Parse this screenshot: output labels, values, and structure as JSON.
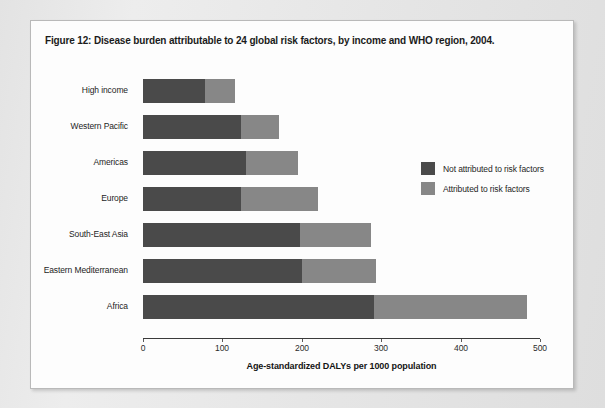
{
  "figure": {
    "title": "Figure 12: Disease burden attributable to 24 global risk factors, by income and WHO region, 2004."
  },
  "legend": {
    "items": [
      {
        "label": "Not attributed to risk factors",
        "color": "#4a4a4a"
      },
      {
        "label": "Attributed to risk factors",
        "color": "#878787"
      }
    ]
  },
  "chart_data": {
    "type": "bar",
    "orientation": "horizontal",
    "stacked": true,
    "title": "Figure 12: Disease burden attributable to 24 global risk factors, by income and WHO region, 2004.",
    "xlabel": "Age-standardized DALYs per 1000 population",
    "ylabel": "",
    "xlim": [
      0,
      500
    ],
    "xticks": [
      0,
      100,
      200,
      300,
      400,
      500
    ],
    "xtick_labels": [
      "0",
      "100",
      "200",
      "300",
      "400",
      "500"
    ],
    "grid": false,
    "legend_position": "inside-right",
    "categories": [
      "High income",
      "Western Pacific",
      "Americas",
      "Europe",
      "South-East Asia",
      "Eastern Mediterranean",
      "Africa"
    ],
    "series": [
      {
        "name": "Not attributed to risk factors",
        "color": "#4a4a4a",
        "values": [
          78,
          123,
          130,
          123,
          198,
          200,
          291
        ]
      },
      {
        "name": "Attributed to risk factors",
        "color": "#878787",
        "values": [
          38,
          48,
          65,
          97,
          89,
          93,
          193
        ]
      }
    ],
    "totals": [
      116,
      171,
      195,
      220,
      287,
      293,
      484
    ]
  }
}
